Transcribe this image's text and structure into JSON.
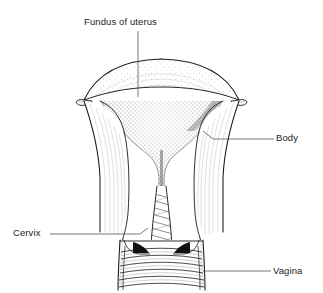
{
  "figure": {
    "background_color": "#ffffff",
    "ink_color": "#1a1a1a",
    "text_color": "#222222",
    "leader_color": "#555555"
  },
  "labels": {
    "fundus": "Fundus of uterus",
    "body": "Body",
    "cervix": "Cervix",
    "vagina": "Vagina"
  },
  "structures": [
    {
      "name": "fundus",
      "label": "Fundus of uterus",
      "description": "Domed superior wall of the uterus with pointed cornua at each side"
    },
    {
      "name": "body",
      "label": "Body",
      "description": "Thick muscular lateral walls of the uterine corpus"
    },
    {
      "name": "uterine-cavity",
      "label": "Uterine cavity",
      "description": "Stippled triangular cavity narrowing into the cervical canal"
    },
    {
      "name": "cervix",
      "label": "Cervix",
      "description": "Narrow neck with diagonal palmate folds of the cervical canal"
    },
    {
      "name": "vagina",
      "label": "Vagina",
      "description": "Lower canal with transverse rugae and dark lateral fornices"
    }
  ]
}
